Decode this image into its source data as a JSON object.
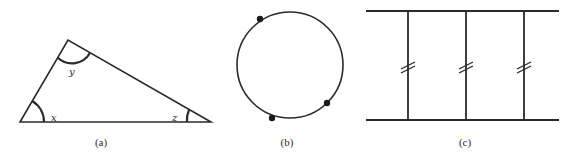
{
  "figures": [
    {
      "id": "a",
      "caption": "(a)",
      "kind": "triangle",
      "angles": {
        "bottom_left": "x",
        "top": "y",
        "bottom_right": "z"
      }
    },
    {
      "id": "b",
      "caption": "(b)",
      "kind": "circle-with-three-points",
      "point_count": 3
    },
    {
      "id": "c",
      "caption": "(c)",
      "kind": "two-parallel-lines-with-three-equal-transversals",
      "tick_mark": "//"
    }
  ],
  "colors": {
    "stroke": "#2a2a2a",
    "background": "#ffffff"
  }
}
